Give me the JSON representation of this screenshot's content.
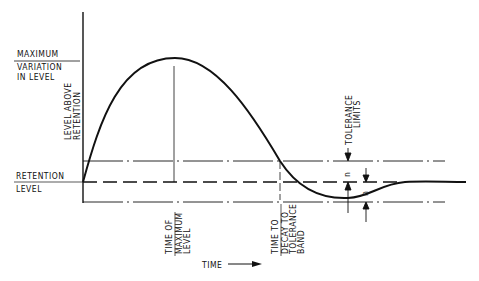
{
  "diagram": {
    "type": "response-curve",
    "labels": {
      "max_variation_line1": "MAXIMUM",
      "max_variation_line2": "VARIATION",
      "max_variation_line3": "IN LEVEL",
      "y_axis_line1": "LEVEL ABOVE",
      "y_axis_line2": "RETENTION",
      "retention_line1": "RETENTION",
      "retention_line2": "LEVEL",
      "time_of_max_line1": "TIME OF",
      "time_of_max_line2": "MAXIMUM",
      "time_of_max_line3": "LEVEL",
      "decay_line1": "TIME TO",
      "decay_line2": "DECAY TO",
      "decay_line3": "TOLERANCE",
      "decay_line4": "BAND",
      "tolerance_line1": "TOLERANCE",
      "tolerance_line2": "LIMITS",
      "n_upper": "n",
      "n_lower": "n",
      "x_axis": "TIME"
    },
    "colors": {
      "ink": "#111111",
      "background": "#ffffff"
    }
  }
}
